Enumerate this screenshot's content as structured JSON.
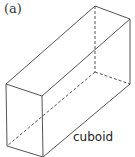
{
  "figure": {
    "panel_label": "(a)",
    "shape_name": "cuboid",
    "line_color": "#555555",
    "vertices": {
      "top_front_left": [
        6,
        84
      ],
      "top_front_right": [
        42,
        96
      ],
      "top_back_left": [
        95,
        6
      ],
      "top_back_right": [
        130,
        19
      ],
      "bottom_front_left": [
        7,
        146
      ],
      "bottom_front_right": [
        43,
        157
      ],
      "bottom_back_right": [
        130,
        84
      ],
      "bottom_back_left_hidden": [
        95,
        72
      ]
    }
  }
}
